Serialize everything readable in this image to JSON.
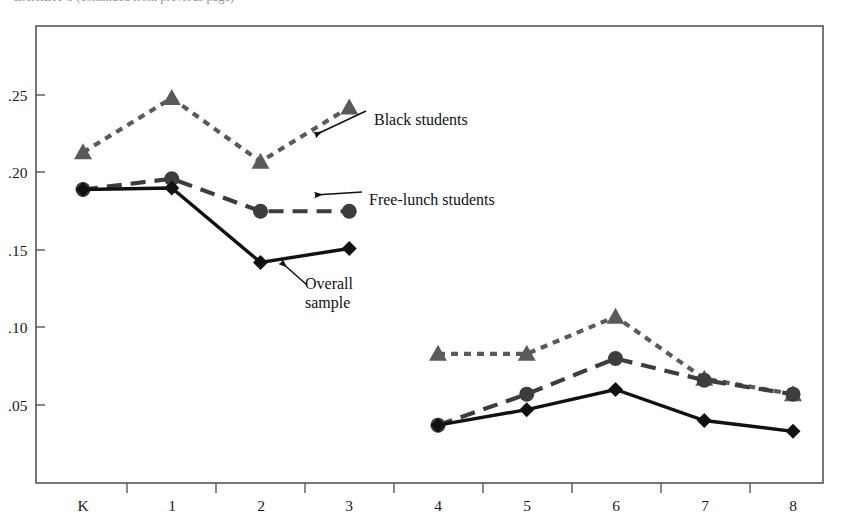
{
  "figure": {
    "caption_clipped": "EXHIBIT 5 (continued from previous page)",
    "background": "#ffffff",
    "frame_color": "#555555"
  },
  "axes": {
    "y_ticks": [
      ".25",
      ".20",
      ".15",
      ".10",
      ".05"
    ],
    "y_tick_values": [
      0.25,
      0.2,
      0.15,
      0.1,
      0.05
    ],
    "x_ticks": [
      "K",
      "1",
      "2",
      "3",
      "4",
      "5",
      "6",
      "7",
      "8"
    ]
  },
  "annotations": [
    {
      "name": "black-students",
      "text": "Black students"
    },
    {
      "name": "free-lunch-students",
      "text": "Free-lunch students"
    },
    {
      "name": "overall-sample-line1",
      "text": "Overall"
    },
    {
      "name": "overall-sample-line2",
      "text": "sample"
    }
  ],
  "colors": {
    "black_students": "#5a5a5a",
    "free_lunch_students": "#3d3d3d",
    "overall_sample": "#111111",
    "axis": "#555555",
    "text": "#111111"
  },
  "chart_data": {
    "type": "line",
    "title": "",
    "xlabel": "",
    "ylabel": "",
    "categories": [
      "K",
      "1",
      "2",
      "3",
      "4",
      "5",
      "6",
      "7",
      "8"
    ],
    "ylim": [
      0.0,
      0.28
    ],
    "yticks": [
      0.05,
      0.1,
      0.15,
      0.2,
      0.25
    ],
    "grid": false,
    "legend": "annotated-inline",
    "note": "Two disconnected segments: grades K-3 and grades 4-8; no line drawn between grade 3 and grade 4.",
    "series": [
      {
        "name": "Black students",
        "marker": "triangle",
        "line_style": "dotted",
        "color": "#5a5a5a",
        "values": [
          0.213,
          0.248,
          0.207,
          0.242,
          0.083,
          0.083,
          0.107,
          0.067,
          0.057
        ]
      },
      {
        "name": "Free-lunch students",
        "marker": "circle",
        "line_style": "dashed",
        "color": "#3d3d3d",
        "values": [
          0.189,
          0.196,
          0.175,
          0.175,
          0.037,
          0.057,
          0.08,
          0.066,
          0.057
        ]
      },
      {
        "name": "Overall sample",
        "marker": "diamond",
        "line_style": "solid",
        "color": "#111111",
        "values": [
          0.189,
          0.19,
          0.142,
          0.151,
          0.037,
          0.047,
          0.06,
          0.04,
          0.033
        ]
      }
    ]
  }
}
